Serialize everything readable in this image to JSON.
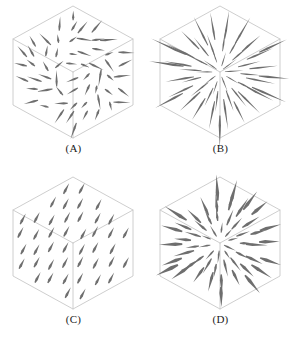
{
  "figure": {
    "type": "vector-field-cube-array",
    "background_color": "#ffffff",
    "cube_edge_color": "#c8c8c8",
    "arrow_color": "#6e6e6e",
    "label_color": "#1a1a1a",
    "rows": 2,
    "columns": 2,
    "panel_count": 4
  },
  "panels": [
    {
      "id": "A",
      "label": "(A)",
      "field_type": "irregular",
      "description": "non-uniform vector field with varied arrow orientations",
      "arrow_count": 96,
      "arrow_length": 13,
      "arrow_width": 1.1,
      "seed": 11
    },
    {
      "id": "B",
      "label": "(B)",
      "field_type": "radial-long",
      "description": "radially divergent field, long thin tapered rays from center",
      "arrow_count": 90,
      "arrow_length": 30,
      "arrow_width": 1.0,
      "seed": 23
    },
    {
      "id": "C",
      "label": "(C)",
      "field_type": "uniform",
      "description": "uniform parallel field, all arrows pointing up and to the right",
      "arrow_count": 64,
      "arrow_length": 12,
      "arrow_width": 1.3,
      "seed": 37,
      "direction_degrees": -62
    },
    {
      "id": "D",
      "label": "(D)",
      "field_type": "radial-short",
      "description": "radially divergent field, shorter thicker tapered arrows from center",
      "arrow_count": 80,
      "arrow_length": 21,
      "arrow_width": 1.5,
      "seed": 53
    }
  ],
  "cube_geometry": {
    "center_x": 73,
    "center_y": 72,
    "half_width": 60,
    "half_height": 66,
    "note": "isometric hexagon outline with three interior edges meeting at inner vertex"
  }
}
